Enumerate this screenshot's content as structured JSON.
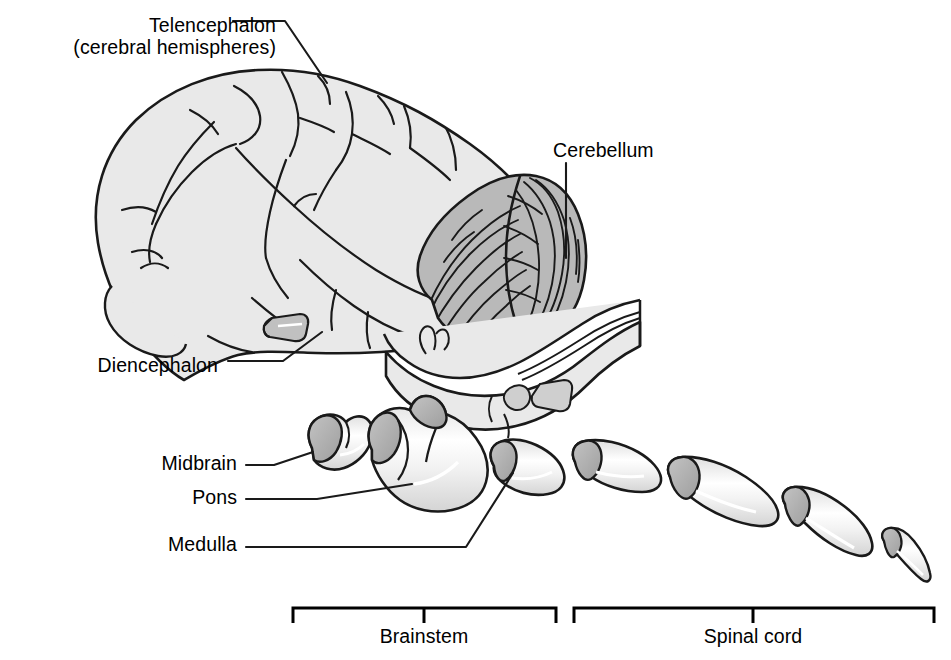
{
  "figure": {
    "background_color": "#ffffff",
    "line_color": "#1a1a1a",
    "cerebrum_fill": "#e9e9e9",
    "cerebellum_fill": "#b9b9b9",
    "segment_fill": "#eeeeee",
    "segment_cap_fill": "#b0b0b0",
    "highlight_color": "#ffffff"
  },
  "labels": {
    "telencephalon_line1": "Telencephalon",
    "telencephalon_line2": "(cerebral hemispheres)",
    "cerebellum": "Cerebellum",
    "diencephalon": "Diencephalon",
    "midbrain": "Midbrain",
    "pons": "Pons",
    "medulla": "Medulla",
    "brainstem": "Brainstem",
    "spinal_cord": "Spinal cord"
  },
  "brackets": [
    {
      "name": "brainstem",
      "label": "Brainstem",
      "x_start": 292,
      "x_end": 557,
      "tick_x": 424,
      "bar_y": 608,
      "tick_y": 623
    },
    {
      "name": "spinal-cord",
      "label": "Spinal cord",
      "x_start": 573,
      "x_end": 935,
      "tick_x": 753,
      "bar_y": 608,
      "tick_y": 623
    }
  ],
  "leader_lines": [
    {
      "name": "telencephalon",
      "points": "233,21 285,21 327,83"
    },
    {
      "name": "cerebellum",
      "points": "566,163 566,258"
    },
    {
      "name": "diencephalon",
      "points": "228,361 283,361 322,332"
    },
    {
      "name": "midbrain",
      "points": "246,465 274,465 313,452"
    },
    {
      "name": "pons",
      "points": "246,499 317,499 412,484"
    },
    {
      "name": "medulla",
      "points": "246,547 466,547 513,473"
    }
  ],
  "brainstem_segments": [
    {
      "name": "midbrain",
      "label": "Midbrain"
    },
    {
      "name": "pons",
      "label": "Pons"
    },
    {
      "name": "medulla",
      "label": "Medulla"
    }
  ],
  "spinal_cord_segments": [
    {
      "name": "spinal-segment-1"
    },
    {
      "name": "spinal-segment-2"
    },
    {
      "name": "spinal-segment-3"
    },
    {
      "name": "spinal-segment-4"
    }
  ]
}
